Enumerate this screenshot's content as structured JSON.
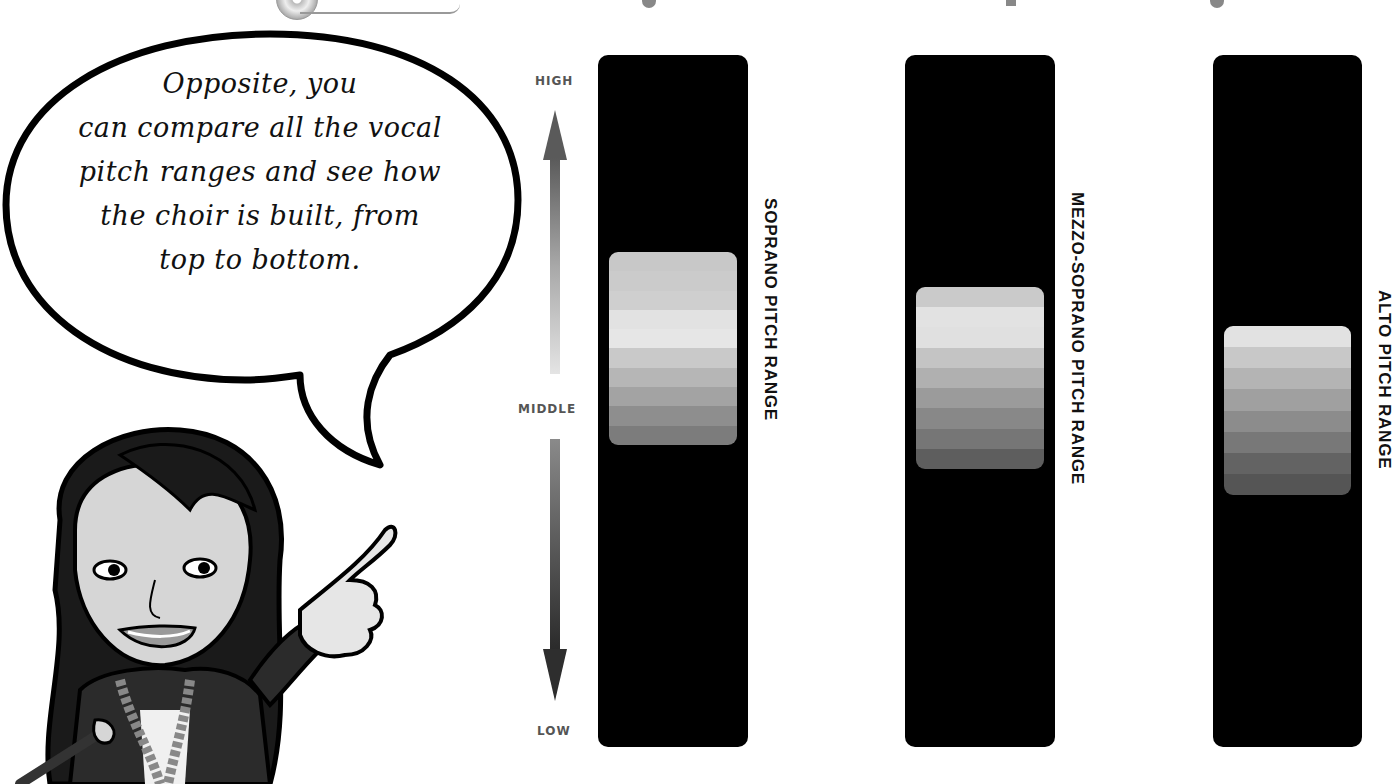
{
  "bubble": {
    "lines": [
      "Opposite, you",
      "can compare all the vocal",
      "pitch ranges and see how",
      "the choir is built, from",
      "top to bottom."
    ]
  },
  "axis": {
    "high": "HIGH",
    "middle": "MIDDLE",
    "low": "LOW"
  },
  "chart_data": {
    "type": "table",
    "title": "",
    "scale": {
      "top": "HIGH",
      "middle": "MIDDLE",
      "bottom": "LOW"
    },
    "series": [
      {
        "name": "SOPRANO PITCH RANGE",
        "band_top_pct": 28.5,
        "band_bottom_pct": 56.5,
        "stripes": 9
      },
      {
        "name": "MEZZO-SOPRANO PITCH RANGE",
        "band_top_pct": 33.5,
        "band_bottom_pct": 60,
        "stripes": 9
      },
      {
        "name": "ALTO PITCH RANGE",
        "band_top_pct": 39,
        "band_bottom_pct": 64,
        "stripes": 8
      }
    ]
  },
  "bars": [
    {
      "label": "SOPRANO PITCH RANGE",
      "left": 598,
      "width": 150,
      "band_top": 197,
      "band_height": 193,
      "stripes": [
        "#c8c8c8",
        "#cbcbcb",
        "#cfcfcf",
        "#e2e2e2",
        "#e6e6e6",
        "#c9c9c9",
        "#b6b6b6",
        "#a3a3a3",
        "#8e8e8e",
        "#7c7c7c"
      ]
    },
    {
      "label": "MEZZO-SOPRANO PITCH RANGE",
      "left": 905,
      "width": 150,
      "band_top": 232,
      "band_height": 182,
      "stripes": [
        "#cacaca",
        "#e2e2e2",
        "#e0e0e0",
        "#c4c4c4",
        "#b0b0b0",
        "#9b9b9b",
        "#888888",
        "#767676",
        "#5e5e5e"
      ]
    },
    {
      "label": "ALTO PITCH RANGE",
      "left": 1213,
      "width": 149,
      "band_top": 271,
      "band_height": 169,
      "stripes": [
        "#e2e2e2",
        "#c8c8c8",
        "#b4b4b4",
        "#a0a0a0",
        "#8c8c8c",
        "#787878",
        "#636363",
        "#555555"
      ]
    }
  ]
}
